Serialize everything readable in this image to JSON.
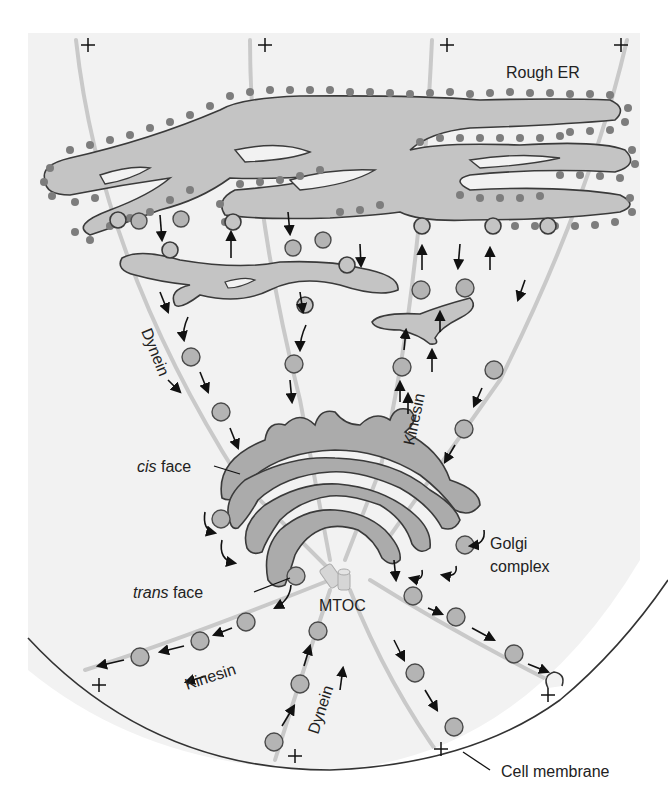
{
  "diagram": {
    "colors": {
      "background": "#ffffff",
      "cytoplasm": "#f2f2f2",
      "membrane_fill": "#c4c4c4",
      "golgi_fill": "#ababab",
      "vesicle_fill": "#b4b4b4",
      "ribosome": "#7d7d7d",
      "microtubule": "#c9c9c9",
      "outline": "#3a3a3a",
      "text": "#222222"
    },
    "labels": {
      "rough_er": "Rough ER",
      "dynein_upper": "Dynein",
      "kinesin_upper": "Kinesin",
      "cis_face_prefix": "cis",
      "cis_face_suffix": " face",
      "golgi_line1": "Golgi",
      "golgi_line2": "complex",
      "trans_face_prefix": "trans",
      "trans_face_suffix": " face",
      "mtoc": "MTOC",
      "kinesin_lower": "Kinesin",
      "dynein_lower": "Dynein",
      "cell_membrane": "Cell membrane"
    },
    "plus_end_marker": "+",
    "icons": {
      "motor_arrow": "arrow-icon",
      "plus_end": "plus-icon",
      "centrioles": "centriole-icon"
    }
  }
}
